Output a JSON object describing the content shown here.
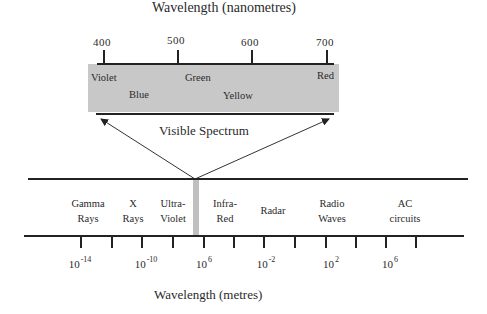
{
  "top_axis": {
    "title": "Wavelength (nanometres)",
    "ticks": [
      {
        "label": "400",
        "x": 104
      },
      {
        "label": "500",
        "x": 178
      },
      {
        "label": "600",
        "x": 252
      },
      {
        "label": "700",
        "x": 327
      }
    ]
  },
  "visible_box": {
    "fill": "#c8c8c8",
    "colors": [
      {
        "label": "Violet",
        "x": 91,
        "y": 72
      },
      {
        "label": "Blue",
        "x": 129,
        "y": 89
      },
      {
        "label": "Green",
        "x": 185,
        "y": 72
      },
      {
        "label": "Yellow",
        "x": 223,
        "y": 90
      },
      {
        "label": "Red",
        "x": 317,
        "y": 70
      }
    ],
    "caption": "Visible Spectrum"
  },
  "bands": [
    {
      "line1": "Gamma",
      "line2": "Rays",
      "x": 88
    },
    {
      "line1": "X",
      "line2": "Rays",
      "x": 133
    },
    {
      "line1": "Ultra-",
      "line2": "Violet",
      "x": 173
    },
    {
      "line1": "Infra-",
      "line2": "Red",
      "x": 225
    },
    {
      "line1": "Radar",
      "line2": "",
      "x": 273
    },
    {
      "line1": "Radio",
      "line2": "Waves",
      "x": 332
    },
    {
      "line1": "AC",
      "line2": "circuits",
      "x": 405
    }
  ],
  "bottom_axis": {
    "title": "Wavelength (metres)",
    "exponent_labels": [
      {
        "base": "10",
        "exp": "-14",
        "x": 80
      },
      {
        "base": "10",
        "exp": "-10",
        "x": 146
      },
      {
        "base": "10",
        "exp": "6",
        "x": 204
      },
      {
        "base": "10",
        "exp": "-2",
        "x": 266
      },
      {
        "base": "10",
        "exp": "2",
        "x": 331
      },
      {
        "base": "10",
        "exp": "6",
        "x": 390
      }
    ],
    "tick_x": [
      81,
      112,
      142,
      173,
      204,
      234,
      264,
      295,
      326,
      356,
      386,
      416
    ]
  },
  "visible_marker": {
    "fill": "#c0c0c0"
  }
}
